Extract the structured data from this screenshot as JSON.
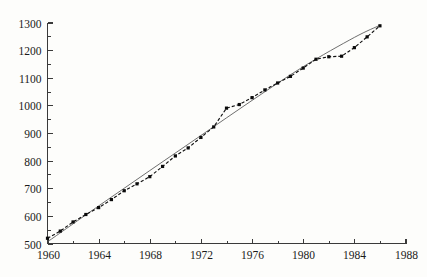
{
  "chart_data": {
    "type": "line",
    "title": "",
    "subtitle": "",
    "xlabel": "",
    "ylabel": "",
    "xlim": [
      1960,
      1988
    ],
    "ylim": [
      500,
      1300
    ],
    "grid": false,
    "legend": "none",
    "x_major_ticks": [
      1960,
      1964,
      1968,
      1972,
      1976,
      1980,
      1984,
      1988
    ],
    "x_minor_ticks": [
      1962,
      1966,
      1970,
      1974,
      1978,
      1982,
      1986
    ],
    "x_tick_labels": [
      "1960",
      "1964",
      "1968",
      "1972",
      "1976",
      "1980",
      "1984",
      "1988"
    ],
    "y_major_ticks": [
      500,
      600,
      700,
      800,
      900,
      1000,
      1100,
      1200,
      1300
    ],
    "y_minor_ticks": [
      550,
      650,
      750,
      850,
      950,
      1050,
      1150,
      1250
    ],
    "y_tick_labels": [
      "500",
      "600",
      "700",
      "800",
      "900",
      "1000",
      "1100",
      "1200",
      "1300"
    ],
    "series": [
      {
        "name": "observed",
        "style": "dashed-with-square-markers",
        "color": "#0a0a0a",
        "x": [
          1960,
          1961,
          1962,
          1963,
          1964,
          1965,
          1966,
          1967,
          1968,
          1969,
          1970,
          1971,
          1972,
          1973,
          1974,
          1975,
          1976,
          1977,
          1978,
          1979,
          1980,
          1981,
          1982,
          1983,
          1984,
          1985,
          1986
        ],
        "values": [
          519,
          545,
          578,
          605,
          630,
          659,
          691,
          716,
          742,
          779,
          817,
          846,
          884,
          922,
          990,
          1003,
          1028,
          1056,
          1081,
          1105,
          1135,
          1167,
          1176,
          1178,
          1209,
          1248,
          1288
        ]
      },
      {
        "name": "fitted-trend",
        "style": "thin-solid-line",
        "color": "#4a4a4a",
        "x": [
          1960,
          1964,
          1968,
          1972,
          1976,
          1980,
          1984,
          1986
        ],
        "values": [
          506,
          636,
          764,
          891,
          1018,
          1140,
          1246,
          1290
        ]
      }
    ]
  },
  "axes": {
    "x_axis_name": "year-axis",
    "y_axis_name": "value-axis"
  }
}
